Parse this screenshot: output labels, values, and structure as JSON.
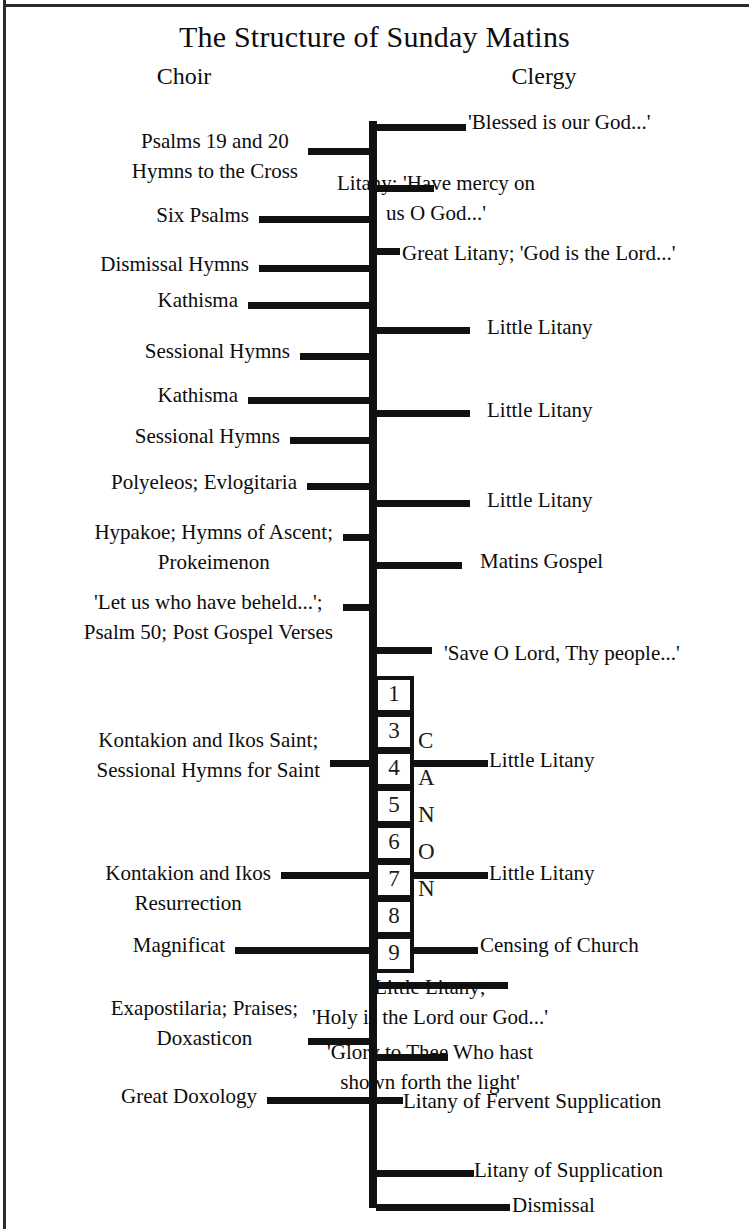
{
  "diagram": {
    "title": "The Structure of Sunday Matins",
    "columns": {
      "left": "Choir",
      "right": "Clergy"
    },
    "spine": {
      "top_y": 121,
      "bottom_y": 1208,
      "x": 369,
      "color": "#111111"
    },
    "choir_items": [
      {
        "text": "Psalms 19 and 20\nHymns to the Cross",
        "tick_y": 148,
        "tick_x": 308,
        "tick_w": 62,
        "label_top": 126,
        "label_right": 298,
        "align": "center"
      },
      {
        "text": "Six Psalms",
        "tick_y": 216,
        "tick_x": 259,
        "tick_w": 111,
        "label_top": 200,
        "label_right": 249,
        "align": "right"
      },
      {
        "text": "Dismissal Hymns",
        "tick_y": 265,
        "tick_x": 259,
        "tick_w": 111,
        "label_top": 249,
        "label_right": 249,
        "align": "right"
      },
      {
        "text": "Kathisma",
        "tick_y": 302,
        "tick_x": 248,
        "tick_w": 122,
        "label_top": 285,
        "label_right": 238,
        "align": "right"
      },
      {
        "text": "Sessional Hymns",
        "tick_y": 353,
        "tick_x": 300,
        "tick_w": 70,
        "label_top": 336,
        "label_right": 290,
        "align": "right"
      },
      {
        "text": "Kathisma",
        "tick_y": 397,
        "tick_x": 248,
        "tick_w": 122,
        "label_top": 380,
        "label_right": 238,
        "align": "right"
      },
      {
        "text": "Sessional Hymns",
        "tick_y": 437,
        "tick_x": 290,
        "tick_w": 80,
        "label_top": 421,
        "label_right": 280,
        "align": "right"
      },
      {
        "text": "Polyeleos; Evlogitaria",
        "tick_y": 483,
        "tick_x": 307,
        "tick_w": 63,
        "label_top": 467,
        "label_right": 297,
        "align": "right"
      },
      {
        "text": "Hypakoe; Hymns of Ascent;\nProkeimenon",
        "tick_y": 534,
        "tick_x": 343,
        "tick_w": 27,
        "label_top": 517,
        "label_right": 333,
        "align": "center"
      },
      {
        "text": "'Let us who have beheld...';\nPsalm 50; Post Gospel Verses",
        "tick_y": 604,
        "tick_x": 343,
        "tick_w": 27,
        "label_top": 587,
        "label_right": 333,
        "align": "center"
      },
      {
        "text": "Kontakion and Ikos Saint;\nSessional Hymns for Saint",
        "tick_y": 760,
        "tick_x": 330,
        "tick_w": 40,
        "label_top": 725,
        "label_right": 320,
        "align": "center"
      },
      {
        "text": "Kontakion and Ikos\nResurrection",
        "tick_y": 872,
        "tick_x": 281,
        "tick_w": 89,
        "label_top": 858,
        "label_right": 271,
        "align": "center"
      },
      {
        "text": "Magnificat",
        "tick_y": 947,
        "tick_x": 235,
        "tick_w": 135,
        "label_top": 930,
        "label_right": 225,
        "align": "right"
      },
      {
        "text": "Exapostilaria; Praises;\nDoxasticon",
        "tick_y": 1038,
        "tick_x": 308,
        "tick_w": 62,
        "label_top": 993,
        "label_right": 298,
        "align": "center"
      },
      {
        "text": "Great Doxology",
        "tick_y": 1097,
        "tick_x": 267,
        "tick_w": 103,
        "label_top": 1081,
        "label_right": 257,
        "align": "right"
      }
    ],
    "clergy_items": [
      {
        "text": "'Blessed is our God...'",
        "tick_y": 124,
        "tick_x": 376,
        "tick_w": 90,
        "label_top": 107,
        "label_left": 468,
        "align": "left"
      },
      {
        "text": "Litany: 'Have mercy on\nus O God...'",
        "tick_y": 185,
        "tick_x": 376,
        "tick_w": 58,
        "label_top": 168,
        "label_left": 436,
        "align": "center"
      },
      {
        "text": "Great Litany; 'God is the Lord...'",
        "tick_y": 248,
        "tick_x": 376,
        "tick_w": 24,
        "label_top": 238,
        "label_left": 402,
        "align": "left"
      },
      {
        "text": "Little Litany",
        "tick_y": 327,
        "tick_x": 376,
        "tick_w": 94,
        "label_top": 312,
        "label_left": 487,
        "align": "left"
      },
      {
        "text": "Little Litany",
        "tick_y": 410,
        "tick_x": 376,
        "tick_w": 94,
        "label_top": 395,
        "label_left": 487,
        "align": "left"
      },
      {
        "text": "Little Litany",
        "tick_y": 500,
        "tick_x": 376,
        "tick_w": 94,
        "label_top": 485,
        "label_left": 487,
        "align": "left"
      },
      {
        "text": "Matins Gospel",
        "tick_y": 562,
        "tick_x": 376,
        "tick_w": 86,
        "label_top": 546,
        "label_left": 480,
        "align": "left"
      },
      {
        "text": "'Save O Lord, Thy people...'",
        "tick_y": 647,
        "tick_x": 376,
        "tick_w": 56,
        "label_top": 638,
        "label_left": 444,
        "align": "left"
      },
      {
        "text": "Little Litany",
        "tick_y": 760,
        "tick_x": 414,
        "tick_w": 74,
        "label_top": 745,
        "label_left": 489,
        "align": "left"
      },
      {
        "text": "Little Litany",
        "tick_y": 872,
        "tick_x": 414,
        "tick_w": 74,
        "label_top": 858,
        "label_left": 489,
        "align": "left"
      },
      {
        "text": "Censing of Church",
        "tick_y": 947,
        "tick_x": 414,
        "tick_w": 64,
        "label_top": 930,
        "label_left": 480,
        "align": "left"
      },
      {
        "text": "Little Litany;\n'Holy is the Lord our God...'",
        "tick_y": 982,
        "tick_x": 376,
        "tick_w": 132,
        "label_top": 972,
        "label_left": 430,
        "align": "center"
      },
      {
        "text": "'Glory to Thee Who hast\nshown forth the light'",
        "tick_y": 1054,
        "tick_x": 376,
        "tick_w": 72,
        "label_top": 1037,
        "label_left": 430,
        "align": "center"
      },
      {
        "text": "Litany of Fervent Supplication",
        "tick_y": 1097,
        "tick_x": 376,
        "tick_w": 27,
        "label_top": 1086,
        "label_left": 403,
        "align": "left"
      },
      {
        "text": "Litany of Supplication",
        "tick_y": 1170,
        "tick_x": 376,
        "tick_w": 98,
        "label_top": 1155,
        "label_left": 474,
        "align": "left"
      },
      {
        "text": "Dismissal",
        "tick_y": 1204,
        "tick_x": 376,
        "tick_w": 134,
        "label_top": 1190,
        "label_left": 512,
        "align": "left"
      }
    ],
    "canon": {
      "word": "CANON",
      "letters": [
        "C",
        "A",
        "N",
        "O",
        "N"
      ],
      "letter_ys": [
        729,
        766,
        803,
        840,
        877
      ],
      "odes": [
        "1",
        "3",
        "4",
        "5",
        "6",
        "7",
        "8",
        "9"
      ],
      "ode_ys": [
        676,
        713,
        750,
        787,
        824,
        861,
        898,
        935
      ],
      "box_height": 38,
      "box_x": 374,
      "box_width": 40
    }
  }
}
